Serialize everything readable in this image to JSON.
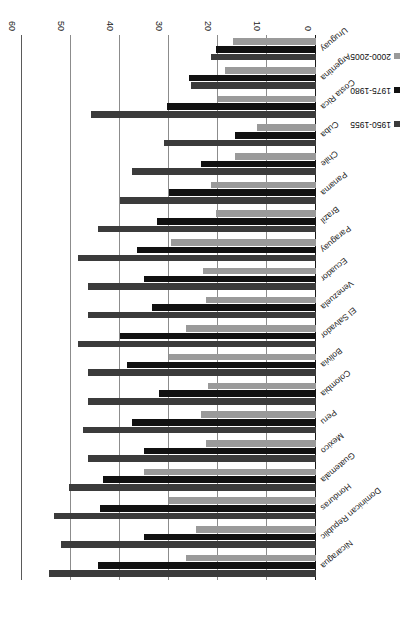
{
  "chart_data": {
    "type": "bar",
    "orientation": "horizontal",
    "title": "",
    "xlabel": "Births per 1,000 population",
    "ylabel": "",
    "xlim": [
      0,
      60
    ],
    "xticks": [
      0,
      10,
      20,
      30,
      40,
      50,
      60
    ],
    "grid": true,
    "legend_position": "bottom-right",
    "rotation_note": "figure printed upside-down (180 degrees)",
    "categories": [
      "Uruguay",
      "Argentina",
      "Costa Rica",
      "Cuba",
      "Chile",
      "Panama",
      "Brazil",
      "Paraguay",
      "Ecuador",
      "Venezuela",
      "El Salvador",
      "Bolivia",
      "Colombia",
      "Peru",
      "Mexico",
      "Guatemala",
      "Honduras",
      "Dominican Republic",
      "Nicaragua"
    ],
    "series": [
      {
        "name": "1950-1955",
        "color": "#3b3b3b",
        "values": [
          21.5,
          25.5,
          46.0,
          31.0,
          37.5,
          40.0,
          44.5,
          48.5,
          46.5,
          46.5,
          48.5,
          46.5,
          46.5,
          47.5,
          46.5,
          50.5,
          53.5,
          52.0,
          54.5
        ]
      },
      {
        "name": "1975-1980",
        "color": "#111111",
        "values": [
          20.5,
          26.0,
          30.5,
          16.5,
          23.5,
          30.0,
          32.5,
          36.5,
          35.0,
          33.5,
          40.0,
          38.5,
          32.0,
          37.5,
          35.0,
          43.5,
          44.0,
          35.0,
          44.5
        ]
      },
      {
        "name": "2000-2005",
        "color": "#9a9a9a",
        "values": [
          17.0,
          18.5,
          20.0,
          12.0,
          16.5,
          21.5,
          20.5,
          29.5,
          23.0,
          22.5,
          26.5,
          30.0,
          22.0,
          23.5,
          22.5,
          35.0,
          30.0,
          24.5,
          26.5
        ]
      }
    ]
  },
  "legend": {
    "items": [
      {
        "label": "1950-1955",
        "swatch_class": "sw1950"
      },
      {
        "label": "1975-1980",
        "swatch_class": "sw1975"
      },
      {
        "label": "2000-2005",
        "swatch_class": "sw2000"
      }
    ]
  }
}
